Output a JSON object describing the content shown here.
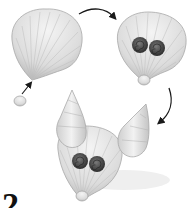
{
  "figure": {
    "type": "craft-instruction-illustration",
    "step_number": "2",
    "colors": {
      "shell": "#e6e6e6",
      "shell_rib": "#b4b4b4",
      "snail_shell": "#4a4a4a",
      "arrow": "#1a1a1a",
      "shadow": "#d8d8d8"
    },
    "stages": [
      {
        "id": "stage-1",
        "label": "scallop shell with small shell attached at base"
      },
      {
        "id": "stage-2",
        "label": "two dark snail shells glued as eyes"
      },
      {
        "id": "stage-3",
        "label": "two conical whelk shells added as ears"
      }
    ],
    "arrows": [
      {
        "from": "small-shell",
        "to": "stage-1"
      },
      {
        "from": "stage-1",
        "to": "stage-2"
      },
      {
        "from": "stage-2",
        "to": "stage-3"
      }
    ]
  }
}
